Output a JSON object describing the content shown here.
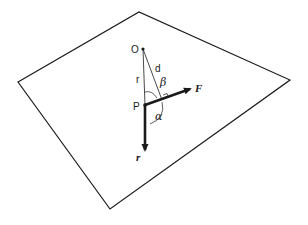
{
  "diagram": {
    "type": "vector-geometry",
    "plane": {
      "vertices": [
        [
          18,
          82
        ],
        [
          139,
          12
        ],
        [
          290,
          80
        ],
        [
          110,
          209
        ]
      ]
    },
    "points": {
      "O": {
        "label": "O",
        "x": 143,
        "y": 49
      },
      "P": {
        "label": "P",
        "x": 145,
        "y": 105
      }
    },
    "segments": {
      "r_line": {
        "label": "r"
      },
      "d_line": {
        "label": "d"
      }
    },
    "vectors": {
      "F": {
        "label": "F"
      },
      "r_vec": {
        "label": "r"
      }
    },
    "angles": {
      "alpha": {
        "label": "α"
      },
      "beta": {
        "label": "β"
      }
    },
    "colors": {
      "stroke": "#1a1a1a",
      "background": "#ffffff"
    }
  }
}
